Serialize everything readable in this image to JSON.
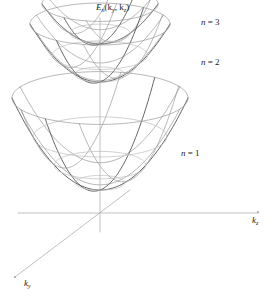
{
  "figure": {
    "type": "3d-surface-diagram",
    "background_color": "#ffffff",
    "width": 279,
    "height": 298
  },
  "axes": {
    "vertical": {
      "name": "energy-axis",
      "label_text": "E",
      "label_sub": "n",
      "label_args": "(k",
      "label_arg1_sub": "y",
      "label_mid": ", k",
      "label_arg2_sub": "z",
      "label_close": ")",
      "color": "#b0b0b0",
      "x": 100,
      "y_top": 18,
      "y_bottom": 232
    },
    "horizontal": {
      "name": "kz-axis",
      "label_text": "k",
      "label_sub": "z",
      "color": "#b0b0b0",
      "y": 213,
      "x_left": 18,
      "x_right": 258
    },
    "depth": {
      "name": "ky-axis",
      "label_text": "k",
      "label_sub": "y",
      "color": "#b0b0b0",
      "x_origin": 100,
      "y_origin": 213,
      "x_end": 15,
      "y_end": 277,
      "x_back": 130,
      "y_back": 190
    }
  },
  "band_labels": [
    {
      "name": "band-label-n3",
      "var": "n",
      "eq": " = 3",
      "level": 3
    },
    {
      "name": "band-label-n2",
      "var": "n",
      "eq": " = 2",
      "level": 2
    },
    {
      "name": "band-label-n1",
      "var": "n",
      "eq": " = 1",
      "level": 1
    }
  ],
  "style": {
    "parabola_color": "#4a4a4a",
    "parabola_color_light": "#9a9a9a",
    "ellipse_color": "#9a9a9a",
    "ellipse_color_faint": "#bdbdbd",
    "line_width": 0.7
  },
  "chart_data": {
    "type": "line",
    "xlabel": "k_z",
    "ylabel": "E_n(k_y, k_z)",
    "zlabel": "k_y",
    "projection": {
      "origin_x": 100,
      "origin_y": 213,
      "ellipse_aspect": 0.3,
      "depth_dx": -0.62,
      "depth_dy": 0.47
    },
    "surfaces": [
      {
        "name": "n = 1",
        "level": 1,
        "vertex_x": 100,
        "vertex_y": 190,
        "rim_y": 98,
        "rim_semi_width": 88,
        "rings": 4,
        "ring_fractions": [
          0.28,
          0.52,
          0.76,
          1.0
        ],
        "profile_count": 5
      },
      {
        "name": "n = 2",
        "level": 2,
        "vertex_x": 100,
        "vertex_y": 82,
        "rim_y": 24,
        "rim_semi_width": 70,
        "rings": 3,
        "ring_fractions": [
          0.36,
          0.68,
          1.0
        ],
        "profile_count": 5
      },
      {
        "name": "n = 3",
        "level": 3,
        "vertex_x": 100,
        "vertex_y": 44,
        "rim_y": 4,
        "rim_semi_width": 58,
        "rings": 2,
        "ring_fractions": [
          0.52,
          1.0
        ],
        "profile_count": 5
      }
    ],
    "legend": [
      "n = 1",
      "n = 2",
      "n = 3"
    ],
    "grid": false,
    "legend_position": "inline-right"
  }
}
